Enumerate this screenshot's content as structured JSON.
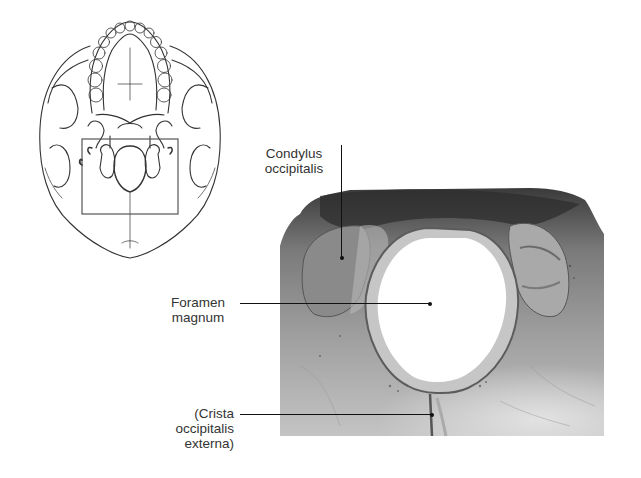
{
  "figure": {
    "overview_drawing": {
      "description": "Inferior view of skull (line drawing) with highlighted region",
      "highlight_box": {
        "x": 82,
        "y": 139,
        "width": 96,
        "height": 75
      }
    },
    "detail_photo": {
      "description": "Photograph of occipital region around foramen magnum",
      "colors": {
        "bone_dark": "#4a4a4a",
        "bone_mid": "#8c8c8c",
        "bone_light": "#c9c9c9",
        "foramen": "#ffffff"
      }
    },
    "labels": [
      {
        "id": "condylus",
        "line1": "Condylus",
        "line2": "occipitalis"
      },
      {
        "id": "foramen",
        "line1": "Foramen",
        "line2": "magnum"
      },
      {
        "id": "crista",
        "line1": "(Crista",
        "line2": "occipitalis",
        "line3": "externa)"
      }
    ]
  }
}
